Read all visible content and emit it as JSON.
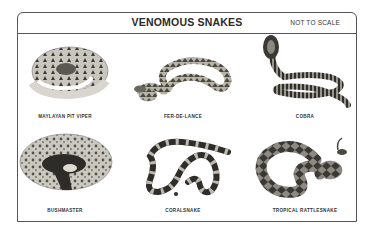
{
  "header": {
    "title": "VENOMOUS SNAKES",
    "scale_note": "NOT TO SCALE"
  },
  "snakes": [
    {
      "name": "MAYLAYAN PIT VIPER",
      "row": 1,
      "col": 1,
      "image": "coiled-pit-viper-photo"
    },
    {
      "name": "FER-DE-LANCE",
      "row": 1,
      "col": 2,
      "image": "fer-de-lance-photo"
    },
    {
      "name": "COBRA",
      "row": 1,
      "col": 3,
      "image": "hooded-cobra-photo"
    },
    {
      "name": "BUSHMASTER",
      "row": 2,
      "col": 1,
      "image": "coiled-bushmaster-photo"
    },
    {
      "name": "CORALSNAKE",
      "row": 2,
      "col": 2,
      "image": "banded-coralsnake-photo"
    },
    {
      "name": "TROPICAL RATTLESNAKE",
      "row": 2,
      "col": 3,
      "image": "tropical-rattlesnake-photo"
    }
  ]
}
